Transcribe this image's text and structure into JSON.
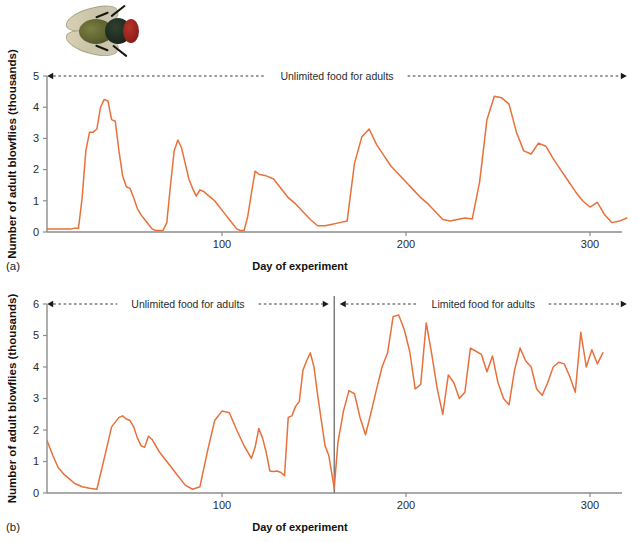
{
  "figure": {
    "line_color": "#e8703a",
    "axis_color": "#8c8c8c",
    "photo": {
      "name": "blowfly-photograph",
      "subject": "adult blowfly"
    }
  },
  "panels": [
    {
      "letter": "(a)",
      "ylabel": "Number of adult blowflies (thousands)",
      "xlabel": "Day of experiment",
      "annotations": [
        {
          "text": "Unlimited food for adults",
          "x_start": 5,
          "x_end": 320,
          "y": 5,
          "arrow": "both"
        }
      ],
      "chart_data": {
        "type": "line",
        "title": "",
        "xlabel": "Day of experiment",
        "ylabel": "Number of adult blowflies (thousands)",
        "xlim": [
          5,
          320
        ],
        "ylim": [
          0,
          5
        ],
        "xticks": [
          100,
          200,
          300
        ],
        "yticks": [
          0,
          1,
          2,
          3,
          4,
          5
        ],
        "grid": false,
        "legend": null,
        "series": [
          {
            "name": "Adult blowflies (unlimited food)",
            "color": "#e8703a",
            "x": [
              5,
              10,
              15,
              18,
              20,
              22,
              24,
              26,
              28,
              30,
              32,
              34,
              36,
              38,
              40,
              42,
              44,
              46,
              48,
              50,
              52,
              54,
              56,
              58,
              60,
              62,
              64,
              66,
              68,
              70,
              72,
              74,
              76,
              78,
              80,
              82,
              84,
              86,
              88,
              90,
              92,
              94,
              96,
              98,
              100,
              102,
              104,
              106,
              108,
              110,
              112,
              114,
              116,
              118,
              120,
              124,
              128,
              132,
              136,
              140,
              144,
              148,
              152,
              156,
              160,
              164,
              168,
              172,
              176,
              180,
              184,
              188,
              192,
              196,
              200,
              204,
              208,
              212,
              216,
              220,
              224,
              228,
              232,
              236,
              240,
              244,
              248,
              252,
              256,
              260,
              264,
              268,
              272,
              276,
              280,
              284,
              288,
              292,
              296,
              300,
              304,
              308,
              312,
              316,
              320
            ],
            "y": [
              0.1,
              0.1,
              0.1,
              0.1,
              0.12,
              0.12,
              1.1,
              2.6,
              3.2,
              3.2,
              3.3,
              4.0,
              4.25,
              4.2,
              3.6,
              3.55,
              2.6,
              1.8,
              1.45,
              1.4,
              1.1,
              0.75,
              0.55,
              0.4,
              0.25,
              0.1,
              0.05,
              0.05,
              0.05,
              0.3,
              1.5,
              2.6,
              2.95,
              2.7,
              2.2,
              1.7,
              1.4,
              1.15,
              1.35,
              1.3,
              1.2,
              1.1,
              1.0,
              0.85,
              0.7,
              0.55,
              0.4,
              0.25,
              0.1,
              0.05,
              0.05,
              0.5,
              1.25,
              1.95,
              1.85,
              1.8,
              1.7,
              1.4,
              1.1,
              0.9,
              0.65,
              0.4,
              0.2,
              0.2,
              0.25,
              0.3,
              0.35,
              2.2,
              3.05,
              3.3,
              2.8,
              2.45,
              2.1,
              1.85,
              1.6,
              1.35,
              1.1,
              0.9,
              0.65,
              0.4,
              0.35,
              0.4,
              0.45,
              0.42,
              1.6,
              3.6,
              4.35,
              4.3,
              4.1,
              3.2,
              2.6,
              2.5,
              2.85,
              2.75,
              2.35,
              2.0,
              1.65,
              1.3,
              1.0,
              0.8,
              0.95,
              0.55,
              0.3,
              0.35,
              0.45
            ]
          }
        ]
      }
    },
    {
      "letter": "(b)",
      "ylabel": "Number of adult blowflies (thousands)",
      "xlabel": "Day of experiment",
      "divider_day": 161,
      "annotations": [
        {
          "text": "Unlimited food for adults",
          "x_start": 5,
          "x_end": 158,
          "y": 6,
          "arrow": "both"
        },
        {
          "text": "Limited food for adults",
          "x_start": 164,
          "x_end": 320,
          "y": 6,
          "arrow": "both"
        }
      ],
      "chart_data": {
        "type": "line",
        "title": "",
        "xlabel": "Day of experiment",
        "ylabel": "Number of adult blowflies (thousands)",
        "xlim": [
          5,
          320
        ],
        "ylim": [
          0,
          6
        ],
        "xticks": [
          100,
          200,
          300
        ],
        "yticks": [
          0,
          1,
          2,
          3,
          4,
          5,
          6
        ],
        "grid": false,
        "legend": null,
        "series": [
          {
            "name": "Adult blowflies (unlimited then limited food)",
            "color": "#e8703a",
            "x": [
              5,
              8,
              11,
              14,
              17,
              20,
              24,
              28,
              32,
              36,
              40,
              44,
              46,
              48,
              50,
              52,
              54,
              56,
              58,
              60,
              62,
              64,
              66,
              68,
              70,
              72,
              74,
              76,
              78,
              80,
              84,
              88,
              92,
              96,
              100,
              104,
              108,
              112,
              116,
              118,
              120,
              122,
              124,
              126,
              128,
              130,
              132,
              134,
              136,
              138,
              140,
              142,
              144,
              146,
              148,
              150,
              152,
              154,
              156,
              158,
              161,
              163,
              166,
              169,
              172,
              175,
              178,
              181,
              184,
              187,
              190,
              193,
              196,
              199,
              202,
              205,
              208,
              211,
              214,
              217,
              220,
              223,
              226,
              229,
              232,
              235,
              238,
              241,
              244,
              247,
              250,
              253,
              256,
              259,
              262,
              265,
              268,
              271,
              274,
              277,
              280,
              283,
              286,
              289,
              292,
              295,
              298,
              301,
              304,
              307,
              310,
              313,
              316,
              319
            ],
            "y": [
              1.65,
              1.2,
              0.8,
              0.6,
              0.45,
              0.3,
              0.2,
              0.15,
              0.12,
              1.1,
              2.1,
              2.4,
              2.45,
              2.35,
              2.3,
              2.1,
              1.75,
              1.5,
              1.45,
              1.8,
              1.7,
              1.5,
              1.3,
              1.15,
              1.0,
              0.85,
              0.7,
              0.55,
              0.4,
              0.25,
              0.12,
              0.2,
              1.3,
              2.3,
              2.6,
              2.55,
              2.0,
              1.5,
              1.1,
              1.45,
              2.05,
              1.75,
              1.3,
              0.7,
              0.68,
              0.7,
              0.65,
              0.55,
              2.4,
              2.45,
              2.75,
              2.9,
              3.9,
              4.2,
              4.45,
              4.0,
              3.1,
              2.3,
              1.5,
              1.2,
              0.15,
              1.6,
              2.6,
              3.25,
              3.15,
              2.4,
              1.85,
              2.55,
              3.3,
              4.0,
              4.45,
              5.6,
              5.65,
              5.2,
              4.5,
              3.3,
              3.45,
              5.4,
              4.4,
              3.3,
              2.5,
              3.75,
              3.5,
              3.0,
              3.2,
              4.6,
              4.5,
              4.4,
              3.85,
              4.35,
              3.5,
              3.0,
              2.8,
              3.9,
              4.6,
              4.2,
              4.0,
              3.3,
              3.1,
              3.5,
              4.0,
              4.15,
              4.1,
              3.7,
              3.2,
              5.1,
              4.0,
              4.55,
              4.1,
              4.45
            ]
          }
        ]
      }
    }
  ]
}
